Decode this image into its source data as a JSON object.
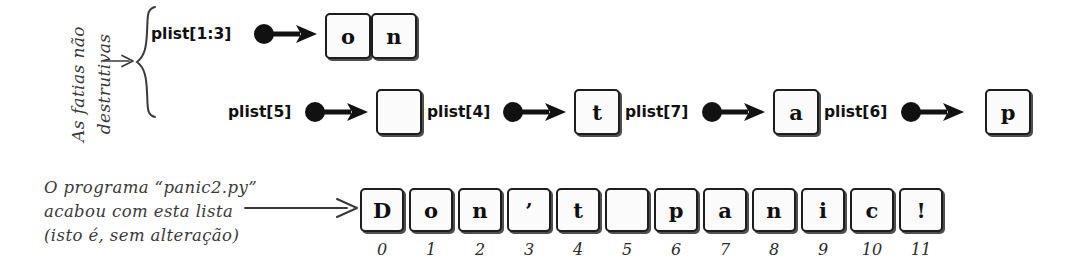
{
  "figure": {
    "background_color": "#ffffff",
    "ink_color": "#1a1a1a"
  },
  "left_annotation": {
    "line1": "As fatias não",
    "line2": "destrutivas",
    "arrow_icon": "arrow-right-icon",
    "brace_icon": "curly-brace-icon"
  },
  "slice_rows": [
    {
      "label": "plist[1:3]",
      "dot_icon": "filled-dot-icon",
      "arrow_icon": "arrow-right-icon",
      "cells": [
        "o",
        "n"
      ]
    },
    {
      "label": "plist[5]",
      "dot_icon": "filled-dot-icon",
      "arrow_icon": "arrow-right-icon",
      "cells": [
        " "
      ]
    },
    {
      "label": "plist[4]",
      "dot_icon": "filled-dot-icon",
      "arrow_icon": "arrow-right-icon",
      "cells": [
        "t"
      ]
    },
    {
      "label": "plist[7]",
      "dot_icon": "filled-dot-icon",
      "arrow_icon": "arrow-right-icon",
      "cells": [
        "a"
      ]
    },
    {
      "label": "plist[6]",
      "dot_icon": "filled-dot-icon",
      "arrow_icon": "arrow-right-icon",
      "cells": [
        "p"
      ]
    }
  ],
  "bottom_annotation": {
    "line1": "O programa “panic2.py”",
    "line2": "acabou com esta lista",
    "line3": "(isto é, sem alteração)",
    "arrow_icon": "long-arrow-right-icon"
  },
  "list_display": {
    "characters": [
      "D",
      "o",
      "n",
      "’",
      "t",
      " ",
      "p",
      "a",
      "n",
      "i",
      "c",
      "!"
    ],
    "indices": [
      "0",
      "1",
      "2",
      "3",
      "4",
      "5",
      "6",
      "7",
      "8",
      "9",
      "10",
      "11"
    ]
  }
}
